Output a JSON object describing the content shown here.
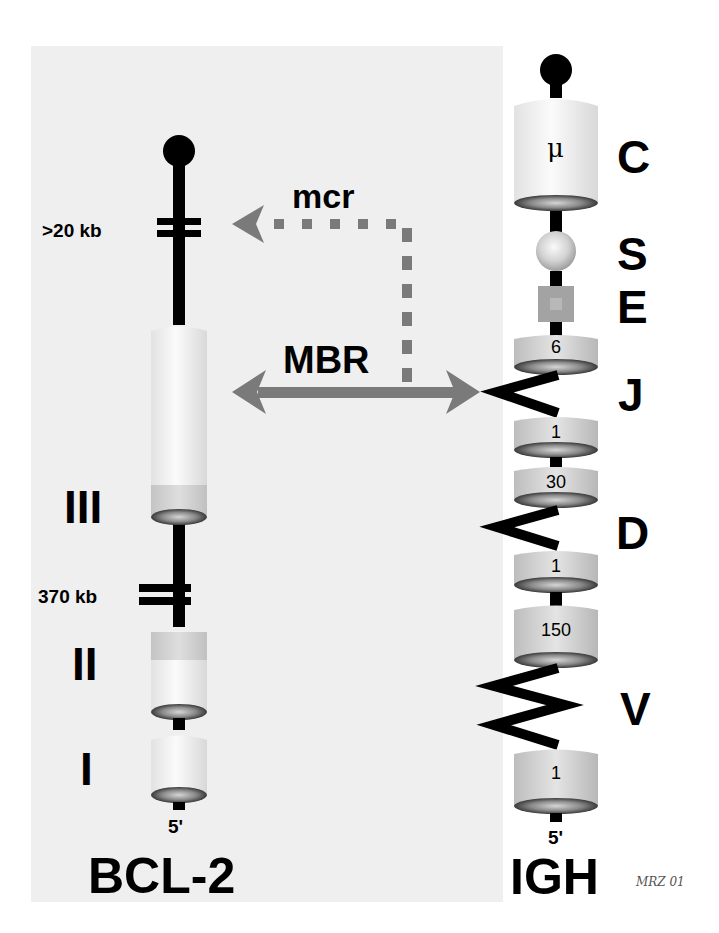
{
  "figure": {
    "background_color": "#efefef",
    "arrow_color": "#7a7a7a",
    "signature": "MRZ 01"
  },
  "bcl2": {
    "gene_label": "BCL-2",
    "five_prime": "5'",
    "gap_top_label": ">20 kb",
    "gap_mid_label": "370 kb",
    "exons": [
      {
        "label": "III"
      },
      {
        "label": "II"
      },
      {
        "label": "I"
      }
    ]
  },
  "igh": {
    "gene_label": "IGH",
    "five_prime": "5'",
    "constant_symbol": "μ",
    "segment_labels": {
      "c": "C",
      "s": "S",
      "e": "E",
      "j": "J",
      "d": "D",
      "v": "V"
    },
    "counts": {
      "j_top": "6",
      "j_bottom": "1",
      "d_top": "30",
      "d_bottom": "1",
      "v_top": "150",
      "v_bottom": "1"
    }
  },
  "breakpoints": {
    "mcr_label": "mcr",
    "mbr_label": "MBR"
  }
}
